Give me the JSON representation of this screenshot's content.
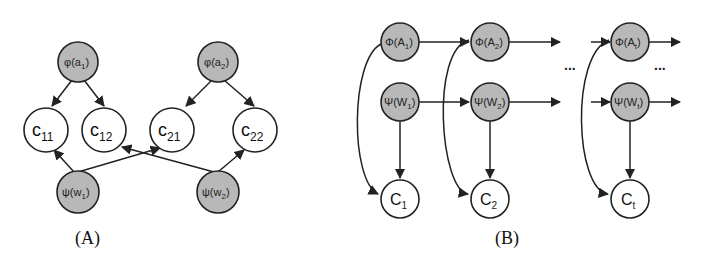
{
  "panels": {
    "A": {
      "caption": "(A)",
      "nodes": {
        "phi_a1": {
          "base": "φ(a",
          "sub": "1",
          "close": ")"
        },
        "phi_a2": {
          "base": "φ(a",
          "sub": "2",
          "close": ")"
        },
        "c11": {
          "base": "c",
          "sub": "11"
        },
        "c12": {
          "base": "c",
          "sub": "12"
        },
        "c21": {
          "base": "c",
          "sub": "21"
        },
        "c22": {
          "base": "c",
          "sub": "22"
        },
        "psi_w1": {
          "base": "ψ(w",
          "sub": "1",
          "close": ")"
        },
        "psi_w2": {
          "base": "ψ(w",
          "sub": "2",
          "close": ")"
        }
      },
      "edges": [
        [
          "phi_a1",
          "c11"
        ],
        [
          "phi_a1",
          "c12"
        ],
        [
          "phi_a2",
          "c21"
        ],
        [
          "phi_a2",
          "c22"
        ],
        [
          "psi_w1",
          "c11"
        ],
        [
          "psi_w1",
          "c21"
        ],
        [
          "psi_w2",
          "c12"
        ],
        [
          "psi_w2",
          "c22"
        ]
      ]
    },
    "B": {
      "caption": "(B)",
      "ellipsis": "...",
      "nodes": {
        "Phi_A1": {
          "base": "Φ(A",
          "sub": "1",
          "close": ")"
        },
        "Phi_A2": {
          "base": "Φ(A",
          "sub": "2",
          "close": ")"
        },
        "Phi_At": {
          "base": "Φ(A",
          "sub": "t",
          "close": ")"
        },
        "Psi_W1": {
          "base": "Ψ(W",
          "sub": "1",
          "close": ")"
        },
        "Psi_W2": {
          "base": "Ψ(W",
          "sub": "2",
          "close": ")"
        },
        "Psi_Wt": {
          "base": "Ψ(W",
          "sub": "t",
          "close": ")"
        },
        "C1": {
          "base": "C",
          "sub": "1"
        },
        "C2": {
          "base": "C",
          "sub": "2"
        },
        "Ct": {
          "base": "C",
          "sub": "t"
        }
      },
      "edges": [
        [
          "Phi_A1",
          "Phi_A2"
        ],
        [
          "Phi_A2",
          "..."
        ],
        [
          "...",
          "Phi_At"
        ],
        [
          "Phi_At",
          "..."
        ],
        [
          "Psi_W1",
          "Psi_W2"
        ],
        [
          "Psi_W2",
          "..."
        ],
        [
          "...",
          "Psi_Wt"
        ],
        [
          "Psi_Wt",
          "..."
        ],
        [
          "Psi_W1",
          "C1"
        ],
        [
          "Psi_W2",
          "C2"
        ],
        [
          "Psi_Wt",
          "Ct"
        ],
        [
          "Phi_A1",
          "C1"
        ],
        [
          "Phi_A1",
          "Phi_A2"
        ],
        [
          "Phi_A2",
          "C2"
        ],
        [
          "Phi_At",
          "Ct"
        ]
      ]
    }
  },
  "colors": {
    "shaded_node": "#b8b8b8",
    "stroke": "#222222",
    "background": "#ffffff"
  }
}
